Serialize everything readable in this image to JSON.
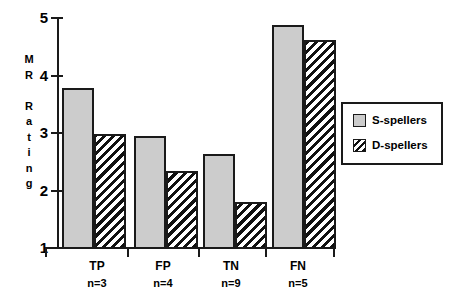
{
  "chart_data": {
    "type": "bar",
    "title": "",
    "xlabel": "",
    "ylabel": "MR Rating",
    "ylabel_letters": [
      "M",
      "R",
      "",
      "R",
      "a",
      "t",
      "i",
      "n",
      "g"
    ],
    "ylim": [
      1,
      5
    ],
    "yticks": [
      1,
      2,
      3,
      4,
      5
    ],
    "ytick_labels": [
      "1",
      "2",
      "3",
      "4",
      "5"
    ],
    "grid": false,
    "legend_position": "right",
    "categories": [
      "TP",
      "FP",
      "TN",
      "FN"
    ],
    "category_sublabels": [
      "n=3",
      "n=4",
      "n=9",
      "n=5"
    ],
    "series": [
      {
        "name": "S-spellers",
        "pattern": "solid-gray",
        "color": "#cccccc",
        "values": [
          3.78,
          2.95,
          2.65,
          4.88
        ]
      },
      {
        "name": "D-spellers",
        "pattern": "diagonal-hatch",
        "color": "#ffffff",
        "values": [
          3.0,
          2.35,
          1.82,
          4.62
        ]
      }
    ]
  },
  "legend": {
    "items": [
      {
        "label": "S-spellers",
        "swatch": "solid-gray-swatch"
      },
      {
        "label": "D-spellers",
        "swatch": "diagonal-hatch-swatch"
      }
    ]
  },
  "axis": {
    "y_labels": [
      "5",
      "4",
      "3",
      "2",
      "1"
    ],
    "y_title_lines": [
      "M",
      "R",
      "",
      "R",
      "a",
      "t",
      "i",
      "n",
      "g"
    ]
  },
  "colors": {
    "axis": "#1a1a1a",
    "s_spellers_fill": "#cccccc",
    "d_spellers_fill": "#ffffff",
    "background": "#ffffff"
  }
}
